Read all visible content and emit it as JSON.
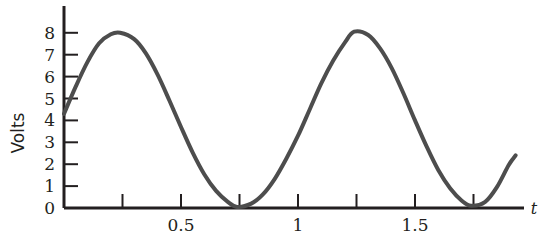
{
  "chart_data": {
    "type": "line",
    "title": "",
    "xlabel": "t",
    "ylabel": "Volts",
    "xlim": [
      0,
      1.95
    ],
    "ylim": [
      0,
      8.6
    ],
    "grid": false,
    "legend": null,
    "x_ticks": [
      0.25,
      0.5,
      0.75,
      1,
      1.25,
      1.5,
      1.75
    ],
    "x_tick_labels": [
      "",
      "0.5",
      "",
      "1",
      "",
      "1.5",
      ""
    ],
    "y_ticks": [
      0,
      1,
      2,
      3,
      4,
      5,
      6,
      7,
      8
    ],
    "y_tick_labels": [
      "0",
      "1",
      "2",
      "3",
      "4",
      "5",
      "6",
      "7",
      "8"
    ],
    "series": [
      {
        "name": "voltage",
        "color": "#4d4d4d",
        "line_width": 4,
        "equation": "V(t) = 4 + 4*sin(2*pi*t + 0.075)",
        "period": 1.0,
        "amplitude": 4,
        "offset": 4,
        "peaks": [
          {
            "t": 0.24,
            "v": 8.0
          },
          {
            "t": 1.24,
            "v": 8.05
          }
        ],
        "minima": [
          {
            "t": 0.74,
            "v": 0.05
          },
          {
            "t": 1.74,
            "v": 0.1
          }
        ],
        "start_point": {
          "t": 0.0,
          "v": 4.3
        },
        "end_point": {
          "t": 1.93,
          "v": 2.4
        },
        "points": [
          {
            "t": 0.0,
            "v": 4.3
          },
          {
            "t": 0.05,
            "v": 5.54
          },
          {
            "t": 0.1,
            "v": 6.66
          },
          {
            "t": 0.15,
            "v": 7.52
          },
          {
            "t": 0.2,
            "v": 7.93
          },
          {
            "t": 0.24,
            "v": 8.0
          },
          {
            "t": 0.3,
            "v": 7.71
          },
          {
            "t": 0.35,
            "v": 7.06
          },
          {
            "t": 0.4,
            "v": 6.09
          },
          {
            "t": 0.45,
            "v": 4.92
          },
          {
            "t": 0.5,
            "v": 3.7
          },
          {
            "t": 0.55,
            "v": 2.53
          },
          {
            "t": 0.6,
            "v": 1.53
          },
          {
            "t": 0.65,
            "v": 0.78
          },
          {
            "t": 0.7,
            "v": 0.28
          },
          {
            "t": 0.74,
            "v": 0.05
          },
          {
            "t": 0.8,
            "v": 0.2
          },
          {
            "t": 0.85,
            "v": 0.62
          },
          {
            "t": 0.9,
            "v": 1.32
          },
          {
            "t": 0.95,
            "v": 2.25
          },
          {
            "t": 1.0,
            "v": 3.3
          },
          {
            "t": 1.05,
            "v": 4.5
          },
          {
            "t": 1.1,
            "v": 5.7
          },
          {
            "t": 1.15,
            "v": 6.72
          },
          {
            "t": 1.2,
            "v": 7.55
          },
          {
            "t": 1.24,
            "v": 8.05
          },
          {
            "t": 1.3,
            "v": 7.9
          },
          {
            "t": 1.35,
            "v": 7.3
          },
          {
            "t": 1.4,
            "v": 6.4
          },
          {
            "t": 1.45,
            "v": 5.25
          },
          {
            "t": 1.5,
            "v": 4.0
          },
          {
            "t": 1.55,
            "v": 2.8
          },
          {
            "t": 1.6,
            "v": 1.72
          },
          {
            "t": 1.65,
            "v": 0.9
          },
          {
            "t": 1.7,
            "v": 0.33
          },
          {
            "t": 1.74,
            "v": 0.1
          },
          {
            "t": 1.8,
            "v": 0.28
          },
          {
            "t": 1.85,
            "v": 0.95
          },
          {
            "t": 1.9,
            "v": 1.95
          },
          {
            "t": 1.93,
            "v": 2.4
          }
        ]
      }
    ]
  },
  "axes": {
    "y_axis_name": "Volts",
    "x_axis_name": "t",
    "axis_color": "#231f20"
  }
}
